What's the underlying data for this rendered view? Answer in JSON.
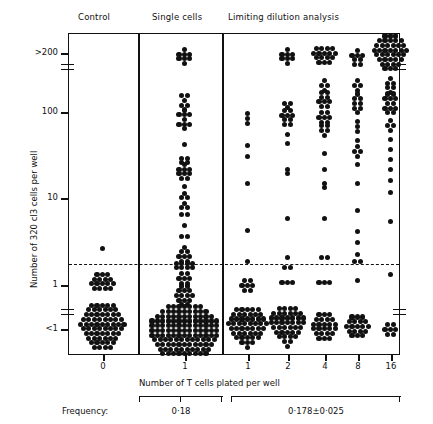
{
  "figure": {
    "headers": [
      {
        "label": "Control",
        "x": 78,
        "y": 14
      },
      {
        "label": "Single cells",
        "x": 155,
        "y": 14
      },
      {
        "label": "Limiting dilution analysis",
        "x": 231,
        "y": 14
      }
    ],
    "y_axis": {
      "title": "Number of 320 cl3 cells per well",
      "ticks": [
        {
          "label": ">200",
          "y": 53
        },
        {
          "label": "100",
          "y": 112
        },
        {
          "label": "10",
          "y": 198
        },
        {
          "label": "1",
          "y": 285
        },
        {
          "label": "<1",
          "y": 329
        }
      ],
      "breaks_y": [
        66,
        312
      ],
      "threshold_y": 263
    },
    "x_axis": {
      "title": "Number of T cells plated per well",
      "ticks": [
        {
          "label": "0",
          "cx": 103
        },
        {
          "label": "1",
          "cx": 185
        },
        {
          "label": "1",
          "cx": 248
        },
        {
          "label": "2",
          "cx": 288
        },
        {
          "label": "4",
          "cx": 325
        },
        {
          "label": "8",
          "cx": 358
        },
        {
          "label": "16",
          "cx": 391
        }
      ]
    },
    "dividers_x": [
      138,
      222
    ],
    "frequency": {
      "label": "Frequency:",
      "groups": [
        {
          "value": "0·18",
          "left": 138,
          "right": 222
        },
        {
          "value": "0·178±0·025",
          "left": 230,
          "right": 400
        }
      ]
    }
  },
  "chart_data": {
    "type": "scatter",
    "xlabel": "Number of T cells plated per well",
    "ylabel": "Number of 320 cl3 cells per well",
    "grid": false,
    "legend": null,
    "panels": [
      "Control",
      "Single cells",
      "Limiting dilution analysis"
    ],
    "categories": [
      "0",
      "1",
      "1",
      "2",
      "4",
      "8",
      "16"
    ],
    "ytick_labels": [
      ">200",
      "100",
      "10",
      "1",
      "<1"
    ],
    "threshold_line": {
      "style": "dashed",
      "between": [
        "1",
        "10"
      ],
      "approx_value": 3
    },
    "frequency_estimates": [
      {
        "group": "Single cells",
        "value": 0.18,
        "error": null,
        "text": "0·18"
      },
      {
        "group": "Limiting dilution analysis",
        "value": 0.178,
        "error": 0.025,
        "text": "0·178±0·025"
      }
    ],
    "series": [
      {
        "name": "Control (0 T cells)",
        "cx": 103,
        "clusters": [
          {
            "y": 249,
            "rows": [
              1
            ]
          },
          {
            "y": 282,
            "rows": [
              3,
              4,
              5,
              4
            ]
          },
          {
            "y": 327,
            "rows": [
              5,
              6,
              7,
              8,
              9,
              8,
              7,
              6,
              5,
              4
            ]
          }
        ]
      },
      {
        "name": "Single cells (1 T cell)",
        "cx": 185,
        "clusters": [
          {
            "y": 57,
            "rows": [
              1,
              3,
              3,
              1
            ]
          },
          {
            "y": 101,
            "rows": [
              2,
              1,
              2
            ]
          },
          {
            "y": 120,
            "rows": [
              1,
              3,
              1,
              3,
              1
            ]
          },
          {
            "y": 145,
            "rows": [
              1
            ]
          },
          {
            "y": 161,
            "rows": [
              2,
              2
            ]
          },
          {
            "y": 172,
            "rows": [
              1,
              3,
              3,
              2
            ]
          },
          {
            "y": 187,
            "rows": [
              1
            ]
          },
          {
            "y": 196,
            "rows": [
              1,
              2
            ]
          },
          {
            "y": 206,
            "rows": [
              1,
              2
            ]
          },
          {
            "y": 215,
            "rows": [
              2
            ]
          },
          {
            "y": 226,
            "rows": [
              1
            ]
          },
          {
            "y": 237,
            "rows": [
              2
            ]
          },
          {
            "y": 248,
            "rows": [
              1
            ]
          },
          {
            "y": 257,
            "rows": [
              2,
              3,
              2
            ]
          },
          {
            "y": 266,
            "rows": [
              4,
              4
            ]
          },
          {
            "y": 279,
            "rows": [
              2,
              3,
              2
            ]
          },
          {
            "y": 296,
            "rows": [
              2,
              3,
              4,
              3,
              2
            ]
          },
          {
            "y": 331,
            "rows": [
              7,
              9,
              11,
              13,
              13,
              13,
              13,
              12,
              11,
              10,
              9
            ]
          }
        ]
      },
      {
        "name": "LDA 1 T cell",
        "cx": 248,
        "clusters": [
          {
            "y": 119,
            "rows": [
              1,
              1,
              1
            ]
          },
          {
            "y": 146,
            "rows": [
              1
            ]
          },
          {
            "y": 157,
            "rows": [
              1
            ]
          },
          {
            "y": 184,
            "rows": [
              1
            ]
          },
          {
            "y": 231,
            "rows": [
              1
            ]
          },
          {
            "y": 262,
            "rows": [
              1
            ]
          },
          {
            "y": 286,
            "rows": [
              2,
              3,
              2
            ]
          },
          {
            "y": 329,
            "rows": [
              5,
              6,
              7,
              8,
              7,
              6,
              5,
              3,
              1
            ]
          }
        ]
      },
      {
        "name": "LDA 2 T cells",
        "cx": 288,
        "clusters": [
          {
            "y": 57,
            "rows": [
              1,
              3,
              3,
              1
            ]
          },
          {
            "y": 106,
            "rows": [
              2,
              1
            ]
          },
          {
            "y": 118,
            "rows": [
              2,
              3,
              2,
              2
            ]
          },
          {
            "y": 135,
            "rows": [
              1
            ]
          },
          {
            "y": 144,
            "rows": [
              1
            ]
          },
          {
            "y": 172,
            "rows": [
              1,
              1
            ]
          },
          {
            "y": 219,
            "rows": [
              1
            ]
          },
          {
            "y": 258,
            "rows": [
              1
            ]
          },
          {
            "y": 268,
            "rows": [
              2
            ]
          },
          {
            "y": 283,
            "rows": [
              3
            ]
          },
          {
            "y": 328,
            "rows": [
              4,
              6,
              7,
              7,
              6,
              5,
              4,
              2,
              1
            ]
          }
        ]
      },
      {
        "name": "LDA 4 T cells",
        "cx": 325,
        "clusters": [
          {
            "y": 56,
            "rows": [
              4,
              5,
              4,
              3
            ]
          },
          {
            "y": 86,
            "rows": [
              1,
              2,
              1
            ]
          },
          {
            "y": 100,
            "rows": [
              2,
              2,
              3,
              2
            ]
          },
          {
            "y": 118,
            "rows": [
              2,
              3,
              2
            ]
          },
          {
            "y": 131,
            "rows": [
              2,
              2,
              1
            ]
          },
          {
            "y": 154,
            "rows": [
              1
            ]
          },
          {
            "y": 170,
            "rows": [
              1
            ]
          },
          {
            "y": 186,
            "rows": [
              1,
              1
            ]
          },
          {
            "y": 219,
            "rows": [
              1
            ]
          },
          {
            "y": 258,
            "rows": [
              2
            ]
          },
          {
            "y": 283,
            "rows": [
              3
            ]
          },
          {
            "y": 327,
            "rows": [
              3,
              4,
              5,
              5,
              4,
              3
            ]
          }
        ]
      },
      {
        "name": "LDA 8 T cells",
        "cx": 358,
        "clusters": [
          {
            "y": 58,
            "rows": [
              1,
              3,
              2,
              2
            ]
          },
          {
            "y": 86,
            "rows": [
              1,
              2,
              1
            ]
          },
          {
            "y": 104,
            "rows": [
              1,
              2,
              2,
              2,
              1
            ]
          },
          {
            "y": 127,
            "rows": [
              1,
              1,
              1
            ]
          },
          {
            "y": 141,
            "rows": [
              1
            ]
          },
          {
            "y": 152,
            "rows": [
              1,
              2,
              1
            ]
          },
          {
            "y": 165,
            "rows": [
              1
            ]
          },
          {
            "y": 184,
            "rows": [
              1
            ]
          },
          {
            "y": 211,
            "rows": [
              1
            ]
          },
          {
            "y": 232,
            "rows": [
              1
            ]
          },
          {
            "y": 243,
            "rows": [
              1
            ]
          },
          {
            "y": 255,
            "rows": [
              1
            ]
          },
          {
            "y": 262,
            "rows": [
              2
            ]
          },
          {
            "y": 281,
            "rows": [
              1
            ]
          },
          {
            "y": 327,
            "rows": [
              3,
              4,
              5,
              4,
              3
            ]
          }
        ]
      },
      {
        "name": "LDA 16 T cells",
        "cx": 391,
        "clusters": [
          {
            "y": 53,
            "rows": [
              3,
              5,
              6,
              7,
              6,
              5,
              4,
              3
            ]
          },
          {
            "y": 86,
            "rows": [
              1,
              2,
              2,
              1
            ]
          },
          {
            "y": 104,
            "rows": [
              2,
              3,
              2,
              3,
              2
            ]
          },
          {
            "y": 126,
            "rows": [
              1,
              2,
              1
            ]
          },
          {
            "y": 140,
            "rows": [
              1
            ]
          },
          {
            "y": 150,
            "rows": [
              1
            ]
          },
          {
            "y": 160,
            "rows": [
              1
            ]
          },
          {
            "y": 170,
            "rows": [
              1
            ]
          },
          {
            "y": 181,
            "rows": [
              1
            ]
          },
          {
            "y": 193,
            "rows": [
              1
            ]
          },
          {
            "y": 222,
            "rows": [
              1
            ]
          },
          {
            "y": 275,
            "rows": [
              1
            ]
          },
          {
            "y": 330,
            "rows": [
              2,
              3,
              2
            ]
          }
        ]
      }
    ]
  }
}
